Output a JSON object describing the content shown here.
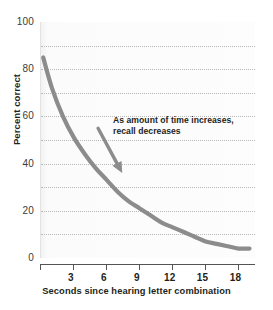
{
  "chart_data": {
    "type": "line",
    "title": "",
    "xlabel": "Seconds since hearing letter combination",
    "ylabel": "Percent correct",
    "xlim": [
      0,
      19.5
    ],
    "ylim": [
      0,
      100
    ],
    "grid": true,
    "grid_interval": 10,
    "legend": "none",
    "x_ticks": [
      0,
      3,
      6,
      9,
      12,
      15,
      18
    ],
    "x_tick_labels": [
      "",
      "3",
      "6",
      "9",
      "12",
      "15",
      "18"
    ],
    "y_ticks": [
      0,
      20,
      40,
      60,
      80,
      100
    ],
    "y_tick_labels": [
      "0",
      "20",
      "40",
      "60",
      "80",
      "100"
    ],
    "series": [
      {
        "name": "Percent correct",
        "color": "#8c8c8c",
        "x": [
          0.2,
          1,
          2,
          3,
          4,
          5,
          6,
          7,
          8,
          9,
          10,
          11,
          12,
          13,
          14,
          15,
          16,
          17,
          18,
          19
        ],
        "values": [
          85,
          72,
          60,
          51,
          44,
          38,
          33,
          28,
          24,
          21,
          18,
          15,
          13,
          11,
          9,
          7,
          6,
          5,
          4,
          4
        ]
      }
    ],
    "annotations": [
      {
        "text": "As amount of time increases, recall decreases",
        "line1": "As amount of time increases,",
        "line2": "recall decreases",
        "arrow": {
          "from_x": 5.2,
          "from_y": 55,
          "to_x": 7.4,
          "to_y": 36,
          "color": "#8c8c8c"
        }
      }
    ]
  },
  "colors": {
    "curve": "#8c8c8c",
    "arrow": "#8c8c8c",
    "grid": "#b9b9b9",
    "axis": "#545454",
    "text": "#231f20",
    "plot_background": "#fdfdfd"
  }
}
